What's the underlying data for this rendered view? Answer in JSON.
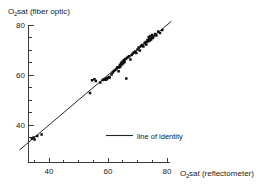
{
  "chart_data": {
    "type": "scatter",
    "title": "",
    "xlabel": "O2 sat (reflectometer)",
    "ylabel": "O2 sat (fiber optic)",
    "xlabel_main": "O",
    "xlabel_sub": "2",
    "xlabel_rest": " sat (reflectometer)",
    "ylabel_main": "O",
    "ylabel_sub": "2",
    "ylabel_rest": " sat (fiber optic)",
    "xlim": [
      30,
      82
    ],
    "ylim": [
      30,
      82
    ],
    "xticks": [
      40,
      60,
      80
    ],
    "yticks": [
      40,
      60,
      80
    ],
    "xtick_labels": [
      "40",
      "60",
      "80"
    ],
    "ytick_labels": [
      "40",
      "60",
      "80"
    ],
    "minor_xticks": [
      35,
      45,
      50,
      55,
      65,
      70,
      75
    ],
    "minor_yticks": [
      35,
      45,
      50,
      55,
      65,
      70,
      75
    ],
    "grid": false,
    "legend_position": "inside-center",
    "legend": [
      {
        "label": "line of identity",
        "marker": "line",
        "color": "#262626"
      }
    ],
    "reference_line": {
      "name": "line of identity",
      "slope": 1,
      "intercept": 0,
      "from": [
        30,
        30
      ],
      "to": [
        81.5,
        81.5
      ]
    },
    "series": [
      {
        "name": "O2 saturation measurements",
        "marker": "filled-square",
        "color": "#0d0d0d",
        "points": [
          [
            34.2,
            34.6
          ],
          [
            34.8,
            35.0
          ],
          [
            35.1,
            34.2
          ],
          [
            36.0,
            35.6
          ],
          [
            37.5,
            36.2
          ],
          [
            53.9,
            52.8
          ],
          [
            54.6,
            57.9
          ],
          [
            55.4,
            58.3
          ],
          [
            55.9,
            57.6
          ],
          [
            57.4,
            57.0
          ],
          [
            58.2,
            58.0
          ],
          [
            58.6,
            58.2
          ],
          [
            59.0,
            58.4
          ],
          [
            59.2,
            58.1
          ],
          [
            59.4,
            58.6
          ],
          [
            59.6,
            58.3
          ],
          [
            59.9,
            58.8
          ],
          [
            60.3,
            59.2
          ],
          [
            60.6,
            59.0
          ],
          [
            61.2,
            60.2
          ],
          [
            61.6,
            61.0
          ],
          [
            62.0,
            61.6
          ],
          [
            62.5,
            62.0
          ],
          [
            62.9,
            62.5
          ],
          [
            63.2,
            63.1
          ],
          [
            63.6,
            61.5
          ],
          [
            63.8,
            63.0
          ],
          [
            64.0,
            64.0
          ],
          [
            64.2,
            63.4
          ],
          [
            64.4,
            64.6
          ],
          [
            64.6,
            65.0
          ],
          [
            64.8,
            64.2
          ],
          [
            65.0,
            65.4
          ],
          [
            65.2,
            64.8
          ],
          [
            65.4,
            66.0
          ],
          [
            65.6,
            65.2
          ],
          [
            65.9,
            66.4
          ],
          [
            66.2,
            58.6
          ],
          [
            66.4,
            66.8
          ],
          [
            66.8,
            67.2
          ],
          [
            67.2,
            67.5
          ],
          [
            67.6,
            66.2
          ],
          [
            68.0,
            68.0
          ],
          [
            68.4,
            68.6
          ],
          [
            68.8,
            69.0
          ],
          [
            69.2,
            69.4
          ],
          [
            69.6,
            68.8
          ],
          [
            70.0,
            70.2
          ],
          [
            70.4,
            71.0
          ],
          [
            70.8,
            69.8
          ],
          [
            71.2,
            71.6
          ],
          [
            71.6,
            72.0
          ],
          [
            72.0,
            71.4
          ],
          [
            72.4,
            72.8
          ],
          [
            72.8,
            73.2
          ],
          [
            73.0,
            72.2
          ],
          [
            73.4,
            74.0
          ],
          [
            73.6,
            73.4
          ],
          [
            73.8,
            75.2
          ],
          [
            74.0,
            74.6
          ],
          [
            74.2,
            73.8
          ],
          [
            74.4,
            75.6
          ],
          [
            74.6,
            74.2
          ],
          [
            74.8,
            75.0
          ],
          [
            75.0,
            76.0
          ],
          [
            75.2,
            74.8
          ],
          [
            75.4,
            75.4
          ],
          [
            76.0,
            76.4
          ],
          [
            76.4,
            75.8
          ],
          [
            77.0,
            77.4
          ],
          [
            77.6,
            76.8
          ],
          [
            78.4,
            78.0
          ]
        ]
      }
    ]
  },
  "colors": {
    "axis": "#3b3b3b",
    "point": "#0d0d0d",
    "line": "#262626",
    "text": "#1a1a1a",
    "background": "#ffffff"
  }
}
